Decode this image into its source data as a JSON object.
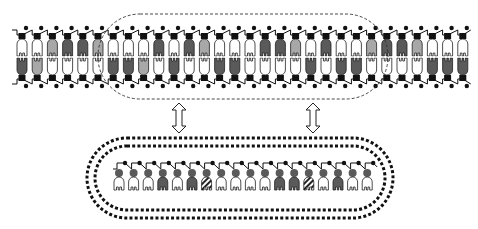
{
  "diagram": {
    "colors": {
      "white": "#ffffff",
      "light": "#a8a8a8",
      "dark": "#5a5a5a",
      "outline": "#222222",
      "backbone": "#111111",
      "highlight_border": "#333333"
    },
    "top_assembly": {
      "unit_count": 30,
      "x_start": 22,
      "spacing": 15.2,
      "upper_strand_colors": [
        "w",
        "w",
        "l",
        "d",
        "d",
        "l",
        "w",
        "w",
        "w",
        "d",
        "w",
        "d",
        "l",
        "w",
        "w",
        "w",
        "d",
        "d",
        "l",
        "w",
        "d",
        "w",
        "w",
        "l",
        "d",
        "d",
        "l",
        "w",
        "w",
        "w"
      ],
      "lower_strand_colors": [
        "d",
        "l",
        "w",
        "w",
        "w",
        "w",
        "d",
        "d",
        "l",
        "w",
        "d",
        "w",
        "w",
        "d",
        "d",
        "w",
        "w",
        "w",
        "w",
        "d",
        "w",
        "d",
        "d",
        "w",
        "w",
        "w",
        "w",
        "d",
        "d",
        "d"
      ],
      "highlight_region": {
        "shape": "dashed-rounded-rect",
        "x": 98,
        "y": 14,
        "width": 290,
        "height": 85
      }
    },
    "arrows": [
      {
        "type": "double-headed",
        "x": 179,
        "y_top": 103,
        "y_bottom": 133
      },
      {
        "type": "double-headed",
        "x": 313,
        "y_top": 103,
        "y_bottom": 133
      }
    ],
    "bottom_ring": {
      "shape": "double-dotted-stadium",
      "x": 87,
      "y": 138,
      "width": 306,
      "height": 80,
      "unit_count": 18,
      "x_start": 119,
      "spacing": 14.6,
      "unit_colors": [
        "w",
        "w",
        "w",
        "d",
        "w",
        "d",
        "s",
        "w",
        "w",
        "w",
        "w",
        "d",
        "d",
        "s",
        "w",
        "d",
        "w",
        "w"
      ]
    }
  }
}
